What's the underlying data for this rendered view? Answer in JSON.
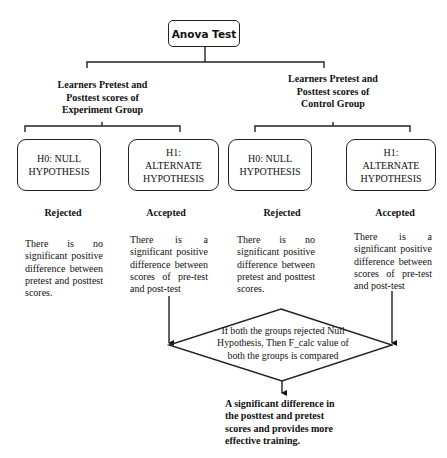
{
  "diagram": {
    "root": {
      "label": "Anova Test"
    },
    "groups": [
      {
        "label": "Learners Pretest and Posttest scores of Experiment Group",
        "label_lines": [
          "Learners Pretest and",
          "Posttest scores of",
          "Experiment Group"
        ],
        "hypotheses": [
          {
            "lines": [
              "H0: NULL",
              "HYPOTHESIS"
            ],
            "verdict": "Rejected",
            "description": "There is no significant positive difference between pretest and posttest scores."
          },
          {
            "lines": [
              "H1:",
              "ALTERNATE",
              "HYPOTHESIS"
            ],
            "verdict": "Accepted",
            "description": "There is a significant positive difference between scores of pre-test and post-test"
          }
        ]
      },
      {
        "label": "Learners Pretest and Posttest scores of Control Group",
        "label_lines": [
          "Learners Pretest and",
          "Posttest scores of",
          "Control Group"
        ],
        "hypotheses": [
          {
            "lines": [
              "H0: NULL",
              "HYPOTHESIS"
            ],
            "verdict": "Rejected",
            "description": "There is no significant positive difference between pretest and posttest scores."
          },
          {
            "lines": [
              "H1:",
              "ALTERNATE",
              "HYPOTHESIS"
            ],
            "verdict": "Accepted",
            "description": "There is a significant positive difference between scores of pre-test and post-test"
          }
        ]
      }
    ],
    "decision": {
      "lines": [
        "If both the groups rejected Null",
        "Hypothesis, Then F_calc value of",
        "both the groups is compared"
      ]
    },
    "conclusion": {
      "lines": [
        "A significant difference in",
        "the posttest and pretest",
        "scores and provides more",
        "effective training."
      ]
    },
    "colors": {
      "stroke": "#222222",
      "text": "#111111",
      "background": "#ffffff"
    }
  }
}
